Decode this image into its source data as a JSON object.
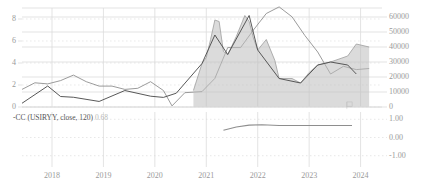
{
  "chart_data": {
    "type": "line",
    "title": "",
    "subtitle": "",
    "xlabel": "",
    "ylabel": "",
    "grid": true,
    "legend_position": "inside-bottom-left",
    "panels": [
      {
        "name": "main",
        "xlim": [
          "2017-06",
          "2024-06"
        ],
        "axes": {
          "left": {
            "label": "Inflation %",
            "lim": [
              0,
              9
            ],
            "ticks": [
              0,
              2,
              4,
              6,
              8
            ],
            "tick_labels": [
              "0",
              "2",
              "4",
              "6",
              "8"
            ]
          },
          "right": {
            "label": "Price",
            "lim": [
              0,
              66000
            ],
            "ticks": [
              0,
              10000,
              20000,
              30000,
              40000,
              50000,
              60000
            ],
            "tick_labels": [
              "0",
              "10000",
              "20000",
              "30000",
              "40000",
              "50000",
              "60000"
            ]
          }
        },
        "series": [
          {
            "name": "USIRYY (US Inflation Rate YoY)",
            "axis": "left",
            "render": "line",
            "color": "#8a8a8a",
            "x": [
              "2017-06",
              "2017-09",
              "2017-12",
              "2018-03",
              "2018-06",
              "2018-09",
              "2018-12",
              "2019-03",
              "2019-06",
              "2019-09",
              "2019-12",
              "2020-03",
              "2020-05",
              "2020-08",
              "2020-12",
              "2021-03",
              "2021-06",
              "2021-09",
              "2021-12",
              "2022-03",
              "2022-06",
              "2022-09",
              "2022-12",
              "2023-03",
              "2023-06",
              "2023-09",
              "2023-12",
              "2024-03"
            ],
            "values": [
              1.6,
              2.2,
              2.1,
              2.4,
              2.9,
              2.3,
              1.9,
              1.9,
              1.6,
              1.7,
              2.3,
              1.5,
              0.1,
              1.3,
              1.4,
              2.6,
              5.4,
              5.4,
              7.0,
              8.5,
              9.1,
              8.2,
              6.5,
              5.0,
              3.0,
              3.7,
              3.4,
              3.5
            ]
          },
          {
            "name": "Price (area)",
            "axis": "right",
            "render": "area",
            "color": "#9e9e9e",
            "fill": "#bdbdbd",
            "x": [
              "2020-10",
              "2020-12",
              "2021-01",
              "2021-02",
              "2021-03",
              "2021-04",
              "2021-05",
              "2021-06",
              "2021-07",
              "2021-08",
              "2021-10",
              "2021-11",
              "2021-12",
              "2022-01",
              "2022-03",
              "2022-05",
              "2022-06",
              "2022-09",
              "2022-11",
              "2023-01",
              "2023-03",
              "2023-06",
              "2023-10",
              "2023-12",
              "2024-03"
            ],
            "values": [
              11000,
              29000,
              33000,
              45000,
              58000,
              57000,
              37000,
              35000,
              41000,
              47000,
              61000,
              57000,
              46000,
              38000,
              45000,
              31000,
              19000,
              19000,
              16000,
              23000,
              28000,
              30000,
              34000,
              42000,
              40000
            ]
          },
          {
            "name": "Price (line)",
            "axis": "right",
            "render": "line",
            "color": "#4f4f4f",
            "x": [
              "2017-06",
              "2017-12",
              "2018-03",
              "2018-06",
              "2018-12",
              "2019-06",
              "2019-12",
              "2020-03",
              "2020-06",
              "2020-12",
              "2021-03",
              "2021-06",
              "2021-11",
              "2022-01",
              "2022-06",
              "2022-11",
              "2023-03",
              "2023-06",
              "2023-10",
              "2023-12"
            ],
            "values": [
              2500,
              14000,
              7000,
              6500,
              3700,
              11000,
              7200,
              6400,
              9200,
              29000,
              48000,
              35000,
              61000,
              38000,
              19000,
              16000,
              28000,
              30000,
              28000,
              22000
            ]
          }
        ]
      },
      {
        "name": "correlation",
        "axes": {
          "right": {
            "lim": [
              -1.4,
              1.4
            ],
            "ticks": [
              1,
              0,
              -1
            ],
            "tick_labels": [
              "1.00",
              "0.00",
              "-1.00"
            ]
          }
        },
        "series": [
          {
            "name": "CC (USIRYY, close, 120)",
            "render": "line",
            "color": "#8e8e8e",
            "x": [
              "2021-05",
              "2021-08",
              "2021-11",
              "2022-02",
              "2022-06",
              "2022-12",
              "2023-06",
              "2023-11"
            ],
            "values": [
              0.4,
              0.58,
              0.68,
              0.7,
              0.66,
              0.66,
              0.66,
              0.66
            ]
          }
        ]
      }
    ],
    "x_ticks": [
      "2018",
      "2019",
      "2020",
      "2021",
      "2022",
      "2023",
      "2024"
    ],
    "annotations": [
      {
        "name": "correlation-legend",
        "text": "-CC (USIRYY, close, 120)",
        "value": "0.68"
      }
    ]
  },
  "colors": {
    "grid": "#dcdcdc",
    "grid_dotted": "#d8d8d8",
    "axis_text": "#9a9a9a",
    "inflation_line": "#8a8a8a",
    "price_line": "#4f4f4f",
    "area_fill": "#bdbdbd",
    "corr_line": "#8e8e8e",
    "legend_text": "#555555",
    "legend_value": "#b9b9b9",
    "background": "#ffffff"
  },
  "icons": {
    "chart_marker": "flag-marker-icon"
  }
}
